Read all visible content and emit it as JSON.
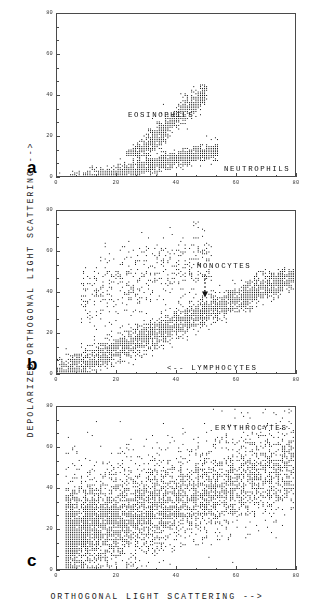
{
  "figure": {
    "y_axis_title": "DEPOLARIZED ORTHOGONAL LIGHT SCATTERING   -->",
    "x_axis_title": "ORTHOGONAL LIGHT SCATTERING   -->",
    "ink_color": "#1a1a1a",
    "frame_color": "#4a4a4a"
  },
  "panels": [
    {
      "letter": "a",
      "annotations": [
        {
          "text": "EOSINOPHILS",
          "x": 24,
          "y": 30
        },
        {
          "text": "NEUTROPHILS",
          "x": 56,
          "y": 3.5
        }
      ]
    },
    {
      "letter": "b",
      "annotations": [
        {
          "text": "MONOCYTES",
          "x": 47,
          "y": 52
        },
        {
          "text": "<-- LYMPHOCYTES",
          "x": 37,
          "y": 2.5
        }
      ]
    },
    {
      "letter": "c",
      "annotations": [
        {
          "text": "ERYTHROCYTES",
          "x": 53,
          "y": 69
        }
      ]
    }
  ],
  "chart_data": {
    "type": "scatter",
    "title": "",
    "xlabel": "ORTHOGONAL LIGHT SCATTERING   -->",
    "ylabel": "DEPOLARIZED ORTHOGONAL LIGHT SCATTERING   -->",
    "xlim": [
      0,
      80
    ],
    "ylim": [
      0,
      80
    ],
    "xticks": [
      0,
      20,
      40,
      60,
      80
    ],
    "yticks": [
      0,
      20,
      40,
      60,
      80
    ],
    "xticklabels": [
      "0",
      "20",
      "40",
      "60",
      "80"
    ],
    "yticklabels": [
      "0",
      "20",
      "40",
      "60",
      "80"
    ],
    "minor_ticks_per_interval": 2,
    "grid": false,
    "legend": "none",
    "marker": "square-dot",
    "marker_color": "#111111",
    "panels": [
      {
        "panel": "a",
        "label": "a",
        "series": [
          {
            "name": "EOSINOPHILS",
            "n_points": 900,
            "description": "Upper diagonal band of high depolarization",
            "x_range": [
              23,
              50
            ],
            "y_range": [
              10,
              46
            ],
            "centroid": [
              39,
              27
            ],
            "slope": 1.35,
            "band_halfwidth": 5.0
          },
          {
            "name": "NEUTROPHILS",
            "n_points": 1600,
            "description": "Dense low band along the x-axis rising slowly",
            "x_range": [
              0,
              54
            ],
            "y_range": [
              0,
              22
            ],
            "centroid": [
              33,
              6
            ],
            "slope": 0.33,
            "band_halfwidth": 3.2
          }
        ]
      },
      {
        "panel": "b",
        "label": "b",
        "series": [
          {
            "name": "LYMPHOCYTES",
            "n_points": 2600,
            "description": "Dominant diagonal band from origin to upper right",
            "x_range": [
              0,
              80
            ],
            "y_range": [
              0,
              52
            ],
            "centroid": [
              38,
              23
            ],
            "slope": 0.62,
            "band_halfwidth": 6.0
          },
          {
            "name": "MONOCYTES",
            "n_points": 500,
            "description": "Sparse scatter cloud above the main band, left-of-centre",
            "x_range": [
              8,
              52
            ],
            "y_range": [
              18,
              76
            ],
            "centroid": [
              26,
              42
            ],
            "slope": 0.5,
            "band_halfwidth": 14.0
          }
        ]
      },
      {
        "panel": "c",
        "label": "c",
        "series": [
          {
            "name": "ERYTHROCYTES",
            "n_points": 5200,
            "description": "Broad dense saturated cloud, dense core low-left, sparse tail to the right",
            "x_range": [
              3,
              80
            ],
            "y_range": [
              0,
              80
            ],
            "centroid": [
              28,
              26
            ],
            "slope": 0.45,
            "band_halfwidth": 16.0
          }
        ]
      }
    ]
  },
  "geometry": {
    "panel_a": {
      "left": 56,
      "top": 13,
      "width": 240,
      "height": 164
    },
    "panel_b": {
      "left": 56,
      "top": 210,
      "width": 240,
      "height": 164
    },
    "panel_c": {
      "left": 56,
      "top": 406,
      "width": 240,
      "height": 164
    }
  }
}
